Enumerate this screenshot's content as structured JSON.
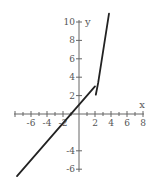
{
  "chart_data": {
    "type": "line",
    "title": "",
    "xlabel": "x",
    "ylabel": "y",
    "xlim": [
      -8,
      8
    ],
    "ylim": [
      -7,
      11
    ],
    "grid": false,
    "legend": null,
    "x_ticks": [
      -6,
      -4,
      -2,
      2,
      4,
      6,
      8
    ],
    "x_tick_labels": [
      "-6",
      "-4",
      "-2",
      "2",
      "4",
      "6",
      "8"
    ],
    "y_ticks": [
      -6,
      -4,
      2,
      4,
      6,
      8,
      10
    ],
    "y_tick_labels": [
      "-6",
      "-4",
      "2",
      "4",
      "6",
      "8",
      "10"
    ],
    "series": [
      {
        "name": "piece-1",
        "description": "line y = x + 1 for x < 2",
        "points": [
          [
            -7.75,
            -6.75
          ],
          [
            2,
            3
          ]
        ]
      },
      {
        "name": "piece-2",
        "description": "steep increasing piece for x >= 2",
        "points": [
          [
            2.1,
            2.1
          ],
          [
            2.4,
            3.4
          ],
          [
            3.75,
            10.9
          ]
        ]
      }
    ],
    "colors": {
      "curve": "#222222",
      "axis": "#666666",
      "background": "#ffffff"
    }
  }
}
